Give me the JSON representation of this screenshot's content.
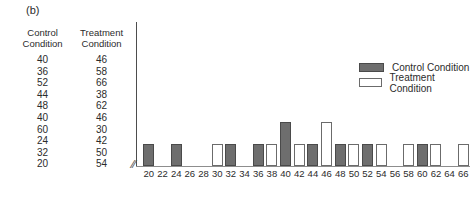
{
  "panel_label": "(b)",
  "table": {
    "headers": [
      {
        "line1": "Control",
        "line2": "Condition"
      },
      {
        "line1": "Treatment",
        "line2": "Condition"
      }
    ],
    "rows": [
      {
        "control": "40",
        "treatment": "46"
      },
      {
        "control": "36",
        "treatment": "58"
      },
      {
        "control": "52",
        "treatment": "66"
      },
      {
        "control": "44",
        "treatment": "38"
      },
      {
        "control": "48",
        "treatment": "62"
      },
      {
        "control": "40",
        "treatment": "46"
      },
      {
        "control": "60",
        "treatment": "30"
      },
      {
        "control": "24",
        "treatment": "42"
      },
      {
        "control": "32",
        "treatment": "50"
      },
      {
        "control": "20",
        "treatment": "54"
      }
    ]
  },
  "legend": {
    "position": "top-center",
    "items": [
      {
        "label": "Control Condition",
        "style": "control",
        "color": "#6e6e6e"
      },
      {
        "label": "Treatment Condition",
        "style": "treatment",
        "color": "#ffffff"
      }
    ]
  },
  "axis": {
    "break_symbol": "//"
  },
  "chart_data": {
    "type": "bar",
    "title": "",
    "xlabel": "",
    "ylabel": "",
    "grid": false,
    "ylim": [
      0,
      3
    ],
    "legend_position": "top-center",
    "categories": [
      "20",
      "22",
      "24",
      "26",
      "28",
      "30",
      "32",
      "34",
      "36",
      "38",
      "40",
      "42",
      "44",
      "46",
      "48",
      "50",
      "52",
      "54",
      "56",
      "58",
      "60",
      "62",
      "64",
      "66"
    ],
    "series": [
      {
        "name": "Control Condition",
        "color": "#6e6e6e",
        "values": [
          1,
          0,
          1,
          0,
          0,
          0,
          1,
          0,
          1,
          0,
          2,
          0,
          1,
          0,
          1,
          0,
          1,
          0,
          0,
          0,
          1,
          0,
          0,
          0
        ]
      },
      {
        "name": "Treatment Condition",
        "color": "#ffffff",
        "values": [
          0,
          0,
          0,
          0,
          0,
          1,
          0,
          0,
          0,
          1,
          0,
          1,
          0,
          2,
          0,
          1,
          0,
          1,
          0,
          1,
          0,
          1,
          0,
          1
        ]
      }
    ]
  }
}
